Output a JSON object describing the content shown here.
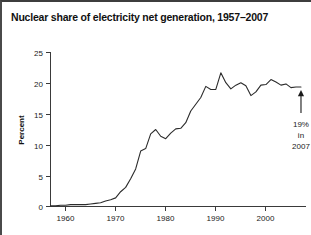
{
  "figure": {
    "title": "Nuclear share of electricity net generation, 1957–2007",
    "background_color": "#ffffff",
    "line_color": "#2b2b2b",
    "axis_color": "#3a3a3a",
    "text_color": "#1a1a1a"
  },
  "annotation": {
    "line1": "19%",
    "line2": "in",
    "line3": "2007",
    "arrow": "up-arrow-icon"
  },
  "chart_data": {
    "type": "line",
    "title": "Nuclear share of electricity net generation, 1957–2007",
    "xlabel": "",
    "ylabel": "Percent",
    "xlim": [
      1957,
      2008
    ],
    "ylim": [
      0,
      25
    ],
    "grid": false,
    "legend": null,
    "x_ticks": [
      1960,
      1970,
      1980,
      1990,
      2000
    ],
    "x_tick_labels": [
      "1960",
      "1970",
      "1980",
      "1990",
      "2000"
    ],
    "y_ticks": [
      0,
      5,
      10,
      15,
      20,
      25
    ],
    "y_tick_labels": [
      "0",
      "5",
      "10",
      "15",
      "20",
      "25"
    ],
    "series": [
      {
        "name": "Nuclear share of electricity net generation",
        "x": [
          1957,
          1958,
          1959,
          1960,
          1961,
          1962,
          1963,
          1964,
          1965,
          1966,
          1967,
          1968,
          1969,
          1970,
          1971,
          1972,
          1973,
          1974,
          1975,
          1976,
          1977,
          1978,
          1979,
          1980,
          1981,
          1982,
          1983,
          1984,
          1985,
          1986,
          1987,
          1988,
          1989,
          1990,
          1991,
          1992,
          1993,
          1994,
          1995,
          1996,
          1997,
          1998,
          1999,
          2000,
          2001,
          2002,
          2003,
          2004,
          2005,
          2006,
          2007
        ],
        "values": [
          0.1,
          0.1,
          0.2,
          0.2,
          0.3,
          0.3,
          0.3,
          0.3,
          0.4,
          0.5,
          0.6,
          0.9,
          1.1,
          1.4,
          2.4,
          3.1,
          4.5,
          6.1,
          9.0,
          9.4,
          11.8,
          12.5,
          11.4,
          11.0,
          11.9,
          12.6,
          12.7,
          13.6,
          15.5,
          16.6,
          17.7,
          19.5,
          19.0,
          19.0,
          21.7,
          20.1,
          19.1,
          19.7,
          20.1,
          19.6,
          18.0,
          18.6,
          19.7,
          19.8,
          20.6,
          20.2,
          19.7,
          19.9,
          19.3,
          19.4,
          19.4
        ]
      }
    ],
    "annotations": [
      {
        "text": "19% in 2007",
        "x": 2007,
        "y": 19.4,
        "style": "up-arrow-with-label"
      }
    ]
  }
}
